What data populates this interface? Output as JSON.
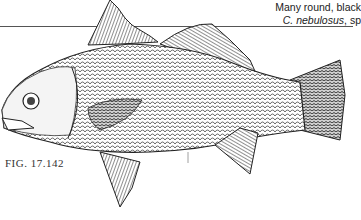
{
  "caption": {
    "line1": "Many round, black",
    "line2_italic": "C. nebulosus",
    "line2_rest": ", sp"
  },
  "figure": {
    "label": "FIG. 17.142"
  },
  "colors": {
    "ink": "#1a1a1a",
    "paper": "#ffffff",
    "rule": "#555555"
  }
}
